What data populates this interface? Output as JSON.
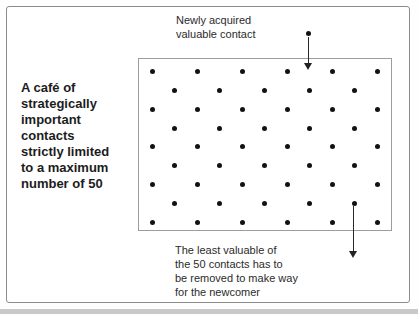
{
  "colors": {
    "background": "#fefefe",
    "frame_border": "#8c8c8c",
    "box_border": "#9c9c9c",
    "dot": "#121212",
    "text_primary": "#1c1c1c",
    "text_annotation": "#2b2b2b",
    "bottom_bar": "#c9c9c9",
    "arrow": "#222222"
  },
  "side_label": {
    "text": "A café of\nstrategically\nimportant\ncontacts\nstrictly limited\nto a maximum\nnumber of 50"
  },
  "annotations": {
    "newcomer": "Newly acquired\nvaluable contact",
    "removed": "The least valuable of\nthe 50 contacts has to\nbe removed to make way\nfor the newcomer"
  },
  "diagram": {
    "total_contacts": 50,
    "grid": {
      "row_y": [
        12,
        31,
        50,
        69,
        87,
        106,
        125,
        144,
        163
      ],
      "odd_row_x": [
        13,
        58,
        103,
        148,
        193,
        238
      ],
      "even_row_x": [
        35,
        80,
        125,
        170,
        215
      ],
      "dot_size": 5
    },
    "newcomer_arrow": {
      "dot_x": 308,
      "dot_y": 33,
      "line_top": 37,
      "line_bottom": 64,
      "tip_y": 70
    },
    "removed_arrow": {
      "x": 353,
      "line_top": 206,
      "line_bottom": 251,
      "tip_y": 258
    }
  }
}
